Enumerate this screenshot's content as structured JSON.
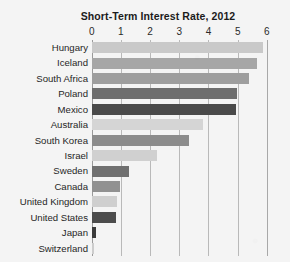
{
  "chart_data": {
    "type": "bar",
    "orientation": "horizontal",
    "title": "Short-Term Interest Rate, 2012",
    "xlabel": "",
    "ylabel": "",
    "xlim": [
      0,
      6
    ],
    "xticks": [
      0,
      1,
      2,
      3,
      4,
      5,
      6
    ],
    "xtick_labels": [
      "0",
      "1",
      "2",
      "3",
      "4",
      "5",
      "6"
    ],
    "grid": true,
    "legend": false,
    "categories": [
      "Hungary",
      "Iceland",
      "South Africa",
      "Poland",
      "Mexico",
      "Australia",
      "South Korea",
      "Israel",
      "Sweden",
      "Canada",
      "United Kingdom",
      "United States",
      "Japan",
      "Switzerland"
    ],
    "values": [
      5.86,
      5.65,
      5.4,
      4.97,
      4.93,
      3.82,
      3.33,
      2.23,
      1.28,
      0.97,
      0.86,
      0.82,
      0.14,
      0.07
    ],
    "bar_colors": [
      "#c9c9c9",
      "#a6a6a6",
      "#9e9e9e",
      "#6e6e6e",
      "#4a4a4a",
      "#d5d5d5",
      "#8c8c8c",
      "#d0d0d0",
      "#707070",
      "#919191",
      "#cfcfcf",
      "#4c4c4c",
      "#3a3a3a",
      "#cdcdcd"
    ]
  },
  "style": {
    "background": "#f4f4f4",
    "gridline_color": "#b9b9b9",
    "text_color": "#262626",
    "title_color": "#1b1b1b"
  }
}
